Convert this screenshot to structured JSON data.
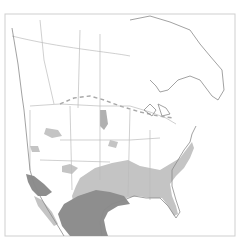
{
  "map": {
    "type": "species-range-map",
    "region": "North America",
    "frame": {
      "x": 5,
      "y": 14,
      "width": 230,
      "height": 222
    },
    "colors": {
      "background": "#ffffff",
      "border_lines": "#b8b8b8",
      "coastline": "#8a8a8a",
      "range_light": "#c4c4c4",
      "range_dark": "#8e8e8e",
      "frame": "#cfcfcf"
    },
    "legend": [],
    "range_areas": [
      {
        "name": "southeastern-us-range",
        "shade": "light"
      },
      {
        "name": "texas-mexico-range",
        "shade": "dark"
      },
      {
        "name": "california-range",
        "shade": "dark"
      },
      {
        "name": "great-plains-patch",
        "shade": "light"
      },
      {
        "name": "intermountain-west-patches",
        "shade": "light"
      }
    ]
  }
}
